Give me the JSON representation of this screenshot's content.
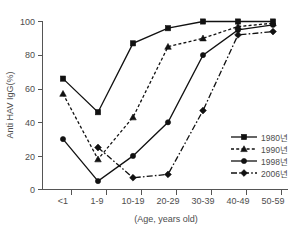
{
  "chart_data": {
    "type": "line",
    "title": "",
    "xlabel": "(Age, years old)",
    "ylabel": "Anti HAV IgG(%)",
    "categories": [
      "<1",
      "1-9",
      "10-19",
      "20-29",
      "30-39",
      "40-49",
      "50-59"
    ],
    "ylim": [
      0,
      100
    ],
    "yticks": [
      0,
      20,
      40,
      60,
      80,
      100
    ],
    "ytick_labels": [
      "0",
      "20",
      "40",
      "60",
      "80",
      "100"
    ],
    "grid": false,
    "legend_position": "bottom-right",
    "series": [
      {
        "name": "1980년",
        "marker": "square",
        "linestyle": "solid",
        "values": [
          66,
          46,
          87,
          96,
          100,
          100,
          100
        ]
      },
      {
        "name": "1990년",
        "marker": "triangle",
        "linestyle": "dotted",
        "values": [
          57,
          18,
          43,
          85,
          90,
          97,
          99
        ]
      },
      {
        "name": "1998년",
        "marker": "circle",
        "linestyle": "solid",
        "values": [
          30,
          5,
          20,
          40,
          80,
          95,
          98
        ]
      },
      {
        "name": "2006년",
        "marker": "diamond",
        "linestyle": "dashdot",
        "values": [
          null,
          25,
          7,
          9,
          47,
          92,
          94
        ]
      }
    ]
  },
  "axis": {
    "y_title": "Anti HAV IgG(%)",
    "x_title": "(Age, years old)",
    "y_labels": [
      "100",
      "80",
      "60",
      "40",
      "20",
      "0"
    ],
    "x_labels": [
      "<1",
      "1-9",
      "10-19",
      "20-29",
      "30-39",
      "40-49",
      "50-59"
    ]
  },
  "legend": {
    "entries": [
      {
        "label": "1980년"
      },
      {
        "label": "1990년"
      },
      {
        "label": "1998년"
      },
      {
        "label": "2006년"
      }
    ]
  },
  "colors": {
    "line": "#111111",
    "axis": "#555555",
    "text": "#4d4d4d",
    "background": "#ffffff"
  }
}
